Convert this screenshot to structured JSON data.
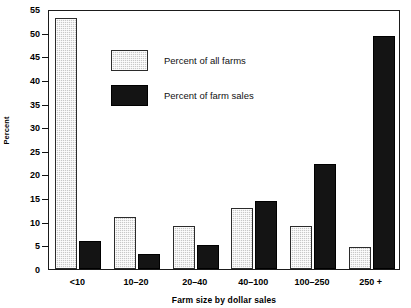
{
  "chart_data": {
    "type": "bar",
    "title": "",
    "xlabel": "Farm size by dollar sales",
    "ylabel": "Percent",
    "categories": [
      "<10",
      "10–20",
      "20–40",
      "40–100",
      "100–250",
      "250 +"
    ],
    "series": [
      {
        "name": "Percent of all farms",
        "color": "#c8c8c8",
        "pattern": "stippled-gray",
        "values": [
          53,
          11,
          9,
          13,
          9,
          4.7
        ]
      },
      {
        "name": "Percent of farm sales",
        "color": "#141414",
        "pattern": "solid-black",
        "values": [
          6,
          3.2,
          5,
          14.4,
          22.2,
          49.3
        ]
      }
    ],
    "ylim": [
      0,
      55
    ],
    "yticks": [
      0,
      5,
      10,
      15,
      20,
      25,
      30,
      35,
      40,
      45,
      50,
      55
    ],
    "ytick_labels": [
      "0",
      "5",
      "10",
      "15",
      "20",
      "25",
      "30",
      "35",
      "40",
      "45",
      "50",
      "55"
    ],
    "grid": false,
    "legend_position": "upper-left-inside",
    "frame": true
  }
}
